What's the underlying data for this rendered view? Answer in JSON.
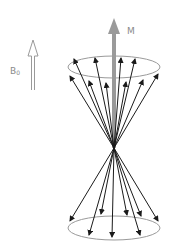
{
  "diagram": {
    "type": "precession-cone",
    "labels": {
      "field": "B",
      "field_subscript": "0",
      "magnetization": "M"
    },
    "colors": {
      "field_arrow": "#9a9a9a",
      "magnetization_arrow": "#9a9a9a",
      "spin_arrows": "#1a1a1a",
      "ellipses": "#9a9a9a",
      "label_text": "#8a8a8a"
    },
    "apex": [
      114,
      148
    ],
    "top_ellipse": {
      "cx": 114,
      "cy": 67,
      "rx": 46,
      "ry": 11
    },
    "bottom_ellipse": {
      "cx": 114,
      "cy": 228,
      "rx": 46,
      "ry": 12
    },
    "top_spin_tips": [
      [
        74,
        59
      ],
      [
        95,
        58
      ],
      [
        121,
        58
      ],
      [
        135,
        59
      ],
      [
        70,
        76
      ],
      [
        89,
        81
      ],
      [
        106,
        83
      ],
      [
        126,
        82
      ],
      [
        143,
        80
      ],
      [
        158,
        74
      ]
    ],
    "bottom_spin_tips": [
      [
        70,
        221
      ],
      [
        101,
        214
      ],
      [
        127,
        215
      ],
      [
        141,
        216
      ],
      [
        158,
        221
      ],
      [
        89,
        235
      ],
      [
        112,
        237
      ],
      [
        140,
        235
      ]
    ]
  }
}
